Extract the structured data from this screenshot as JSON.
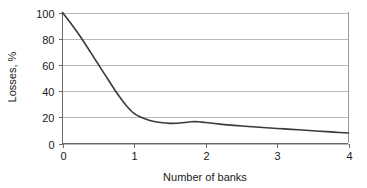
{
  "chart_data": {
    "type": "line",
    "title": "",
    "subtitle": "",
    "xlabel": "Number of banks",
    "ylabel": "Losses, %",
    "xlim": [
      0,
      4
    ],
    "ylim": [
      0,
      100
    ],
    "x_ticks": [
      "0",
      "1",
      "2",
      "3",
      "4"
    ],
    "y_ticks": [
      "0",
      "20",
      "40",
      "60",
      "80",
      "100"
    ],
    "x_tick_values": [
      0,
      1,
      2,
      3,
      4
    ],
    "y_tick_values": [
      0,
      20,
      40,
      60,
      80,
      100
    ],
    "grid": "horizontal",
    "legend": "none",
    "legend_position": "none",
    "annotations": [],
    "series": [
      {
        "name": "Losses",
        "color": "#3a3a3a",
        "x": [
          0.0,
          0.1,
          0.2,
          0.3,
          0.4,
          0.5,
          0.6,
          0.7,
          0.8,
          0.9,
          1.0,
          1.1,
          1.2,
          1.3,
          1.4,
          1.5,
          1.6,
          1.7,
          1.8,
          1.9,
          2.0,
          2.2,
          2.4,
          2.6,
          2.8,
          3.0,
          3.2,
          3.4,
          3.6,
          3.8,
          4.0
        ],
        "y": [
          100.0,
          93.0,
          85.5,
          77.5,
          69.0,
          60.5,
          52.0,
          43.5,
          35.5,
          28.5,
          23.0,
          20.0,
          18.0,
          16.6,
          15.8,
          15.4,
          15.5,
          16.0,
          16.6,
          16.6,
          16.0,
          14.8,
          13.8,
          13.0,
          12.2,
          11.5,
          10.8,
          10.1,
          9.4,
          8.7,
          8.0
        ]
      }
    ]
  },
  "axes": {
    "y_axis_title": "Losses, %",
    "x_axis_title": "Number of banks"
  },
  "colors": {
    "series": "#3a3a3a",
    "grid": "#b8b8b8",
    "axis": "#6b6b6b",
    "text": "#1a1a1a",
    "background": "#ffffff"
  }
}
